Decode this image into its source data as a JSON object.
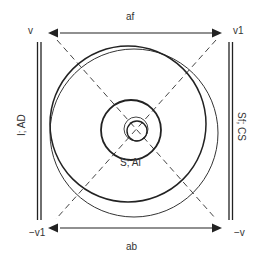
{
  "labels": {
    "top_left": "v",
    "top_right": "v1",
    "bottom_left": "−v1",
    "bottom_right": "−v",
    "top": "af",
    "bottom": "ab",
    "left": "I; AD",
    "right": "Sf; CS",
    "center": "S; AI"
  },
  "colors": {
    "stroke": "#222222",
    "text": "#333333",
    "dash": "#444444",
    "background": "#ffffff"
  }
}
